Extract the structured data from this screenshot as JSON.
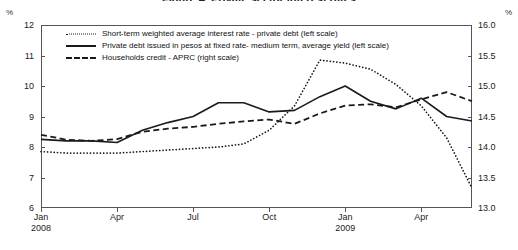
{
  "chart_data": {
    "type": "line",
    "title": "Figure 4. Private sector interest rates",
    "ylabel_left_unit": "%",
    "ylabel_right_unit": "%",
    "xlabel": "",
    "ylim_left": [
      6,
      12
    ],
    "ylim_right": [
      13.0,
      16.0
    ],
    "yticks_left": [
      "12",
      "11",
      "10",
      "9",
      "8",
      "7",
      "6"
    ],
    "yticks_right": [
      "16.0",
      "15.5",
      "15.0",
      "14.5",
      "14.0",
      "13.5",
      "13.0"
    ],
    "grid": false,
    "legend_position": "top-left-inside",
    "x": [
      "Jan 2008",
      "Feb 2008",
      "Mar 2008",
      "Apr 2008",
      "May 2008",
      "Jun 2008",
      "Jul 2008",
      "Aug 2008",
      "Sep 2008",
      "Oct 2008",
      "Nov 2008",
      "Dec 2008",
      "Jan 2009",
      "Feb 2009",
      "Mar 2009",
      "Apr 2009",
      "May 2009",
      "Jun 2009"
    ],
    "xticks": [
      {
        "label": "Jan",
        "year": "2008",
        "index": 0
      },
      {
        "label": "Apr",
        "year": "",
        "index": 3
      },
      {
        "label": "Jul",
        "year": "",
        "index": 6
      },
      {
        "label": "Oct",
        "year": "",
        "index": 9
      },
      {
        "label": "Jan",
        "year": "2009",
        "index": 12
      },
      {
        "label": "Apr",
        "year": "",
        "index": 15
      }
    ],
    "series": [
      {
        "name": "Short-term weighted average interest rate - private debt (left scale)",
        "key": "dotted",
        "scale": "left",
        "values": [
          7.85,
          7.8,
          7.8,
          7.8,
          7.85,
          7.9,
          7.95,
          8.0,
          8.1,
          8.55,
          9.35,
          10.85,
          10.75,
          10.55,
          10.05,
          9.35,
          8.3,
          6.65
        ]
      },
      {
        "name": "Private debt issued in pesos at fixed rate- medium term, average yield (left scale)",
        "key": "solid",
        "scale": "left",
        "values": [
          8.25,
          8.2,
          8.2,
          8.15,
          8.55,
          8.8,
          9.0,
          9.45,
          9.45,
          9.15,
          9.2,
          9.65,
          10.0,
          9.5,
          9.25,
          9.6,
          9.0,
          8.85
        ]
      },
      {
        "name": "Households credit - APRC (right scale)",
        "key": "dashed",
        "scale": "right",
        "values": [
          14.2,
          14.12,
          14.1,
          14.13,
          14.25,
          14.3,
          14.33,
          14.38,
          14.42,
          14.45,
          14.38,
          14.55,
          14.68,
          14.7,
          14.65,
          14.78,
          14.9,
          14.75
        ]
      }
    ]
  }
}
